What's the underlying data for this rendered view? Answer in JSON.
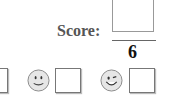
{
  "score": {
    "label": "Score:",
    "total": "6"
  },
  "rating": {
    "items": [
      {
        "icon": "partial-box"
      },
      {
        "icon": "smiley-icon"
      },
      {
        "icon": "winking-smiley-icon"
      }
    ]
  }
}
